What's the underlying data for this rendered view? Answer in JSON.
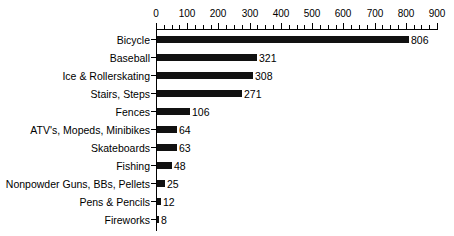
{
  "chart_data": {
    "type": "bar",
    "orientation": "horizontal",
    "title": "",
    "subtitle": "",
    "xlabel": "",
    "ylabel": "",
    "xlim": [
      0,
      900
    ],
    "grid": false,
    "legend": null,
    "axis_position": "top",
    "tick_step": 100,
    "minor_tick_step": 25,
    "tick_labels": [
      "0",
      "100",
      "200",
      "300",
      "400",
      "500",
      "600",
      "700",
      "800",
      "900"
    ],
    "tick_values": [
      0,
      100,
      200,
      300,
      400,
      500,
      600,
      700,
      800,
      900
    ],
    "categories": [
      "Bicycle",
      "Baseball",
      "Ice & Rollerskating",
      "Stairs, Steps",
      "Fences",
      "ATV's, Mopeds, Minibikes",
      "Skateboards",
      "Fishing",
      "Nonpowder Guns, BBs, Pellets",
      "Pens & Pencils",
      "Fireworks"
    ],
    "values": [
      806,
      321,
      308,
      271,
      106,
      64,
      63,
      48,
      25,
      12,
      8
    ],
    "value_labels": [
      "806",
      "321",
      "308",
      "271",
      "106",
      "64",
      "63",
      "48",
      "25",
      "12",
      "8"
    ],
    "bar_color": "#111111",
    "axis_color": "#000000",
    "background_color": "#ffffff"
  }
}
